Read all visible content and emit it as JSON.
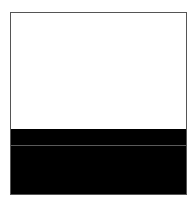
{
  "figure": {
    "colors": {
      "border": "#555555",
      "upper_fill": "#ffffff",
      "lower_fill": "#000000",
      "divider_line": "#5a5a5a"
    }
  }
}
